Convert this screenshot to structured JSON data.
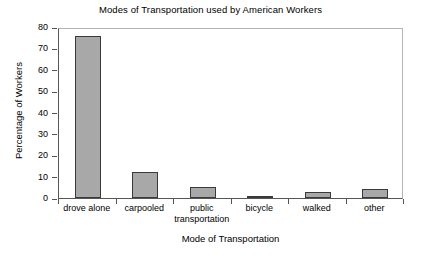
{
  "chart_data": {
    "type": "bar",
    "title": "Modes of Transportation used by American Workers",
    "xlabel": "Mode of Transportation",
    "ylabel": "Percentage of Workers",
    "categories": [
      "drove alone",
      "public transportation",
      "carpooled",
      "bicycle",
      "walked",
      "other"
    ],
    "category_lines": [
      [
        "drove alone"
      ],
      [
        "carpooled"
      ],
      [
        "public",
        "transportation"
      ],
      [
        "bicycle"
      ],
      [
        "walked"
      ],
      [
        "other"
      ]
    ],
    "values": [
      76,
      12,
      5,
      0.5,
      3,
      4
    ],
    "ylim": [
      0,
      80
    ],
    "yticks": [
      0,
      10,
      20,
      30,
      40,
      50,
      60,
      70,
      80
    ],
    "ytick_labels": [
      "0",
      "10",
      "20",
      "30",
      "40",
      "50",
      "60",
      "70",
      "80"
    ],
    "grid": false,
    "legend": "none",
    "bar_color": "#a8a8a8",
    "bar_border_color": "#3a3a3a",
    "axis_color": "#555555",
    "background_color": "#ffffff"
  }
}
